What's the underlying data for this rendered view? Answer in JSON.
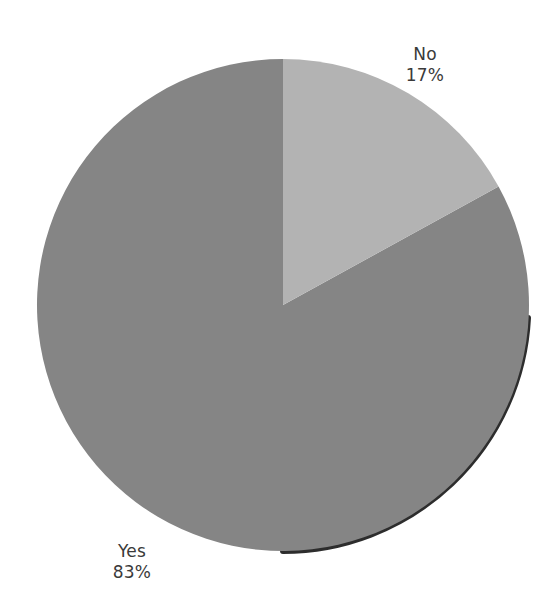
{
  "chart_data": {
    "type": "pie",
    "title": "",
    "subtitle": "",
    "xlabel": "",
    "ylabel": "",
    "grid": false,
    "legend_position": "none",
    "labels_position": "outside",
    "start_angle_deg": 0,
    "direction": "clockwise",
    "categories": [
      "No",
      "Yes"
    ],
    "values": [
      17,
      83
    ],
    "units": "percent",
    "slices": [
      {
        "label": "No",
        "value": 17,
        "value_text": "17%",
        "color": "#b3b3b3",
        "start_angle_deg": 0,
        "end_angle_deg": 61.2
      },
      {
        "label": "Yes",
        "value": 83,
        "value_text": "83%",
        "color": "#858585",
        "start_angle_deg": 61.2,
        "end_angle_deg": 360
      }
    ],
    "annotations": [
      {
        "text": "No",
        "value_text": "17%"
      },
      {
        "text": "Yes",
        "value_text": "83%"
      }
    ]
  },
  "figure": {
    "background_color": "#ffffff",
    "text_color": "#3a3a3a",
    "shadow_color": "#1a1a1a"
  },
  "labels": {
    "no": {
      "name": "No",
      "value": "17%"
    },
    "yes": {
      "name": "Yes",
      "value": "83%"
    }
  }
}
